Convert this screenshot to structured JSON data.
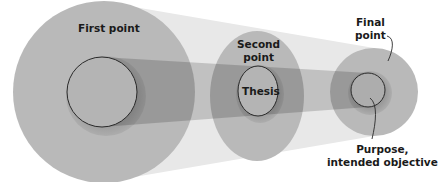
{
  "diagram": {
    "type": "concentric-progression",
    "colors": {
      "background": "#ffffff",
      "cone": "#e6e6e6",
      "outer_circle": "#b8b8b8",
      "band": "#9a9a9a",
      "inner_fill": "#b3b3b3",
      "outline": "#2a2a2a",
      "text": "#1a1a1a"
    },
    "nodes": [
      {
        "id": "first",
        "label": "First point"
      },
      {
        "id": "second",
        "label_line1": "Second",
        "label_line2": "point",
        "inner_label": "Thesis"
      },
      {
        "id": "final",
        "label_line1": "Final",
        "label_line2": "point"
      }
    ],
    "annotation": {
      "line1": "Purpose,",
      "line2": "intended objective"
    }
  }
}
